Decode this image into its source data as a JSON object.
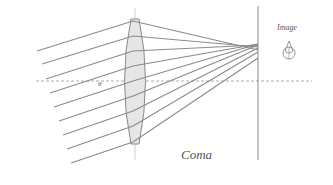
{
  "diagram": {
    "title": "Coma",
    "image_label": "Image",
    "angle_label": "θ",
    "colors": {
      "rays": "#8a8a8a",
      "lens_fill": "#e6e6e6",
      "axis": "#9a9a9a",
      "text": "#555555"
    },
    "lens": {
      "cx": 135,
      "top": 20,
      "bottom": 143,
      "half_width": 12
    },
    "optical_axis_y": 81,
    "image_plane_x": 258,
    "rays": [
      {
        "start": [
          37,
          51
        ],
        "lens": [
          133,
          21
        ],
        "end": [
          258,
          50
        ]
      },
      {
        "start": [
          42,
          64
        ],
        "lens": [
          133,
          36
        ],
        "end": [
          258,
          47
        ]
      },
      {
        "start": [
          46,
          79
        ],
        "lens": [
          133,
          51
        ],
        "end": [
          258,
          45
        ]
      },
      {
        "start": [
          50,
          93
        ],
        "lens": [
          133,
          66
        ],
        "end": [
          258,
          44
        ]
      },
      {
        "start": [
          54,
          107
        ],
        "lens": [
          133,
          81
        ],
        "end": [
          258,
          44
        ]
      },
      {
        "start": [
          59,
          121
        ],
        "lens": [
          133,
          96
        ],
        "end": [
          258,
          45
        ]
      },
      {
        "start": [
          63,
          135
        ],
        "lens": [
          133,
          111
        ],
        "end": [
          258,
          48
        ]
      },
      {
        "start": [
          67,
          149
        ],
        "lens": [
          133,
          126
        ],
        "end": [
          258,
          52
        ]
      },
      {
        "start": [
          71,
          163
        ],
        "lens": [
          133,
          142
        ],
        "end": [
          258,
          58
        ]
      }
    ]
  }
}
